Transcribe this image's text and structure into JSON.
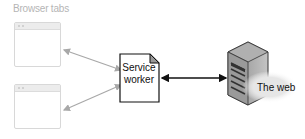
{
  "diagram": {
    "browser_tabs_label": "Browser tabs",
    "service_worker_label_line1": "Service",
    "service_worker_label_line2": "worker",
    "web_label": "The web",
    "nodes": [
      {
        "id": "tab-1",
        "type": "browser-window"
      },
      {
        "id": "tab-2",
        "type": "browser-window"
      },
      {
        "id": "service-worker",
        "type": "document",
        "label": "Service worker"
      },
      {
        "id": "server",
        "type": "server",
        "label": "The web"
      }
    ],
    "edges": [
      {
        "from": "tab-1",
        "to": "service-worker",
        "bidirectional": true,
        "color": "#a8a8a8"
      },
      {
        "from": "tab-2",
        "to": "service-worker",
        "bidirectional": true,
        "color": "#a8a8a8"
      },
      {
        "from": "service-worker",
        "to": "server",
        "bidirectional": true,
        "color": "#111111"
      }
    ]
  }
}
